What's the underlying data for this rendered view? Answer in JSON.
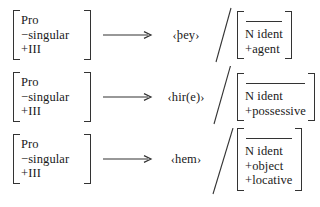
{
  "diagram": {
    "type": "linguistic-rewrite-rules",
    "background_color": "#ffffff",
    "ink_color": "#1a1a1a",
    "arrow_glyph": "rightwards-arrow",
    "separator_glyph": "slash",
    "rules": [
      {
        "input": {
          "lines": [
            "Pro",
            "−singular",
            "+III"
          ],
          "blank_first_line": false
        },
        "output_form": "‹þey›",
        "separator": "/",
        "environment": {
          "blank_first_line": true,
          "lines": [
            "N ident",
            "+agent"
          ]
        }
      },
      {
        "input": {
          "lines": [
            "Pro",
            "−singular",
            "+III"
          ],
          "blank_first_line": false
        },
        "output_form": "‹hir(e)›",
        "separator": "/",
        "environment": {
          "blank_first_line": true,
          "lines": [
            "N ident",
            "+possessive"
          ]
        }
      },
      {
        "input": {
          "lines": [
            "Pro",
            "−singular",
            "+III"
          ],
          "blank_first_line": false
        },
        "output_form": "‹hem›",
        "separator": "/",
        "environment": {
          "blank_first_line": true,
          "lines": [
            "N ident",
            "+object",
            "+locative"
          ]
        }
      }
    ]
  }
}
